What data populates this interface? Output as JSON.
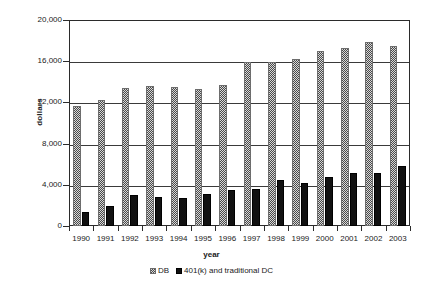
{
  "chart_data": {
    "type": "bar",
    "title": "",
    "xlabel": "year",
    "ylabel": "dollars",
    "categories": [
      "1990",
      "1991",
      "1992",
      "1993",
      "1994",
      "1995",
      "1996",
      "1997",
      "1998",
      "1999",
      "2000",
      "2001",
      "2002",
      "2003"
    ],
    "series": [
      {
        "name": "DB",
        "values": [
          11700,
          12200,
          13400,
          13600,
          13500,
          13300,
          13700,
          15900,
          15900,
          16200,
          17000,
          17300,
          17900,
          17500
        ]
      },
      {
        "name": "401(k) and traditional DC",
        "values": [
          1400,
          1950,
          3050,
          2800,
          2700,
          3150,
          3500,
          3600,
          4450,
          4200,
          4750,
          5150,
          5150,
          5800
        ]
      }
    ],
    "ylim": [
      0,
      20000
    ],
    "yticks": [
      0,
      4000,
      8000,
      12000,
      16000,
      20000
    ],
    "ytick_labels": [
      "0",
      "4,000",
      "8,000",
      "12,000",
      "16,000",
      "20,000"
    ],
    "grid": true,
    "legend_position": "bottom",
    "colors": {
      "db": "#808080",
      "dc": "#111111",
      "axis": "#2b2b2b",
      "grid": "#3a3a3a",
      "background": "#ffffff"
    }
  },
  "axes": {
    "y_title": "dollars",
    "x_title": "year"
  },
  "legend": {
    "entries": [
      {
        "label": "DB",
        "swatch": "hatched-square-icon"
      },
      {
        "label": "401(k) and traditional DC",
        "swatch": "solid-square-icon"
      }
    ]
  }
}
